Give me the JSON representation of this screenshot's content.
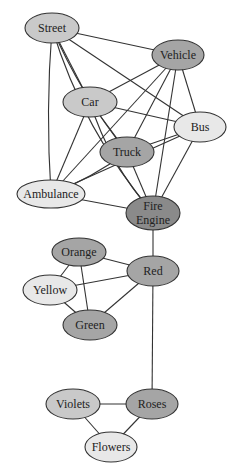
{
  "diagram": {
    "type": "network-graph",
    "colors": {
      "light": "#e8e8e8",
      "medium": "#c9c9c9",
      "dark": "#a5a5a5",
      "darkest": "#8a8a8a",
      "edge": "#333333"
    },
    "nodes": [
      {
        "id": "street",
        "label": "Street",
        "x": 52,
        "y": 28,
        "rx": 27,
        "ry": 15,
        "shade": "medium"
      },
      {
        "id": "vehicle",
        "label": "Vehicle",
        "x": 178,
        "y": 55,
        "rx": 26,
        "ry": 15,
        "shade": "dark"
      },
      {
        "id": "car",
        "label": "Car",
        "x": 90,
        "y": 102,
        "rx": 27,
        "ry": 15,
        "shade": "medium"
      },
      {
        "id": "bus",
        "label": "Bus",
        "x": 200,
        "y": 127,
        "rx": 26,
        "ry": 15,
        "shade": "light"
      },
      {
        "id": "truck",
        "label": "Truck",
        "x": 127,
        "y": 152,
        "rx": 27,
        "ry": 15,
        "shade": "dark"
      },
      {
        "id": "ambulance",
        "label": "Ambulance",
        "x": 51,
        "y": 194,
        "rx": 34,
        "ry": 14,
        "shade": "light"
      },
      {
        "id": "fire-engine",
        "label": "Fire",
        "label2": "Engine",
        "x": 153,
        "y": 213,
        "rx": 27,
        "ry": 17,
        "shade": "darkest"
      },
      {
        "id": "orange",
        "label": "Orange",
        "x": 79,
        "y": 252,
        "rx": 27,
        "ry": 14,
        "shade": "dark"
      },
      {
        "id": "red",
        "label": "Red",
        "x": 153,
        "y": 271,
        "rx": 26,
        "ry": 15,
        "shade": "dark"
      },
      {
        "id": "yellow",
        "label": "Yellow",
        "x": 50,
        "y": 290,
        "rx": 27,
        "ry": 15,
        "shade": "light"
      },
      {
        "id": "green",
        "label": "Green",
        "x": 90,
        "y": 325,
        "rx": 27,
        "ry": 15,
        "shade": "dark"
      },
      {
        "id": "violets",
        "label": "Violets",
        "x": 73,
        "y": 404,
        "rx": 27,
        "ry": 15,
        "shade": "medium"
      },
      {
        "id": "roses",
        "label": "Roses",
        "x": 152,
        "y": 404,
        "rx": 26,
        "ry": 15,
        "shade": "dark"
      },
      {
        "id": "flowers",
        "label": "Flowers",
        "x": 111,
        "y": 447,
        "rx": 26,
        "ry": 15,
        "shade": "light"
      }
    ],
    "edges": [
      {
        "from": "street",
        "to": "vehicle"
      },
      {
        "from": "street",
        "to": "car"
      },
      {
        "from": "street",
        "to": "bus"
      },
      {
        "from": "street",
        "to": "truck",
        "curve": 10
      },
      {
        "from": "street",
        "to": "ambulance",
        "curve": 6
      },
      {
        "from": "street",
        "to": "fire-engine",
        "curve": 22
      },
      {
        "from": "vehicle",
        "to": "car"
      },
      {
        "from": "vehicle",
        "to": "bus"
      },
      {
        "from": "vehicle",
        "to": "truck"
      },
      {
        "from": "vehicle",
        "to": "ambulance"
      },
      {
        "from": "vehicle",
        "to": "fire-engine"
      },
      {
        "from": "car",
        "to": "bus"
      },
      {
        "from": "car",
        "to": "truck"
      },
      {
        "from": "car",
        "to": "ambulance"
      },
      {
        "from": "car",
        "to": "fire-engine",
        "curve": 14
      },
      {
        "from": "bus",
        "to": "truck"
      },
      {
        "from": "bus",
        "to": "ambulance"
      },
      {
        "from": "bus",
        "to": "fire-engine"
      },
      {
        "from": "truck",
        "to": "ambulance",
        "curve": -6
      },
      {
        "from": "truck",
        "to": "fire-engine"
      },
      {
        "from": "ambulance",
        "to": "fire-engine"
      },
      {
        "from": "fire-engine",
        "to": "red"
      },
      {
        "from": "orange",
        "to": "red"
      },
      {
        "from": "orange",
        "to": "yellow"
      },
      {
        "from": "orange",
        "to": "green"
      },
      {
        "from": "yellow",
        "to": "red"
      },
      {
        "from": "yellow",
        "to": "green"
      },
      {
        "from": "green",
        "to": "red"
      },
      {
        "from": "red",
        "to": "roses"
      },
      {
        "from": "violets",
        "to": "roses"
      },
      {
        "from": "violets",
        "to": "flowers"
      },
      {
        "from": "roses",
        "to": "flowers"
      }
    ]
  }
}
